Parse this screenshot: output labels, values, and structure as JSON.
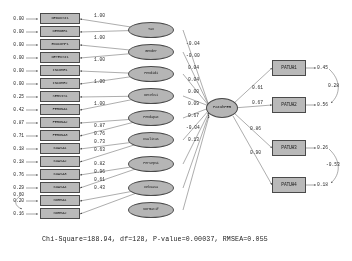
{
  "diagram": {
    "type": "sem-path-diagram",
    "title": "",
    "fit_statistics": "Chi-Square=188.94, df=128, P-value=0.00037, RMSEA=0.055",
    "fit_parts": {
      "chi_square_label": "Chi-Square",
      "chi_square": "188.94",
      "df_label": "df",
      "df": "128",
      "pvalue_label": "P-value",
      "pvalue": "0.00037",
      "rmsea_label": "RMSEA",
      "rmsea": "0.055"
    },
    "center_latent": {
      "label": "PatuhPER"
    },
    "indicators": [
      {
        "error": "0.00",
        "name": "DEDUKSI1",
        "loading": "1.00"
      },
      {
        "error": "0.00",
        "name": "DEMOGR1",
        "loading": "1.00"
      },
      {
        "error": "0.00",
        "name": "EDUCOMP1",
        "loading": "1.00"
      },
      {
        "error": "0.00",
        "name": "DETEKSI1",
        "loading": "1.00"
      },
      {
        "error": "0.00",
        "name": "INCOME1",
        "loading": "1.00"
      },
      {
        "error": "0.00",
        "name": "INCOME2",
        "loading": "1.00"
      },
      {
        "error": "0.25",
        "name": "SERVIS1",
        "loading": "1.00"
      },
      {
        "error": "0.42",
        "name": "FERONA1",
        "loading": "1.00"
      },
      {
        "error": "0.87",
        "name": "FERONA2",
        "loading": "0.87"
      },
      {
        "error": "0.71",
        "name": "FERONA3",
        "loading": "0.76"
      },
      {
        "error": "0.18",
        "name": "KUASA1",
        "loading": "0.73"
      },
      {
        "error": "0.18",
        "name": "KUASA2",
        "loading": "0.63"
      },
      {
        "error": "0.76",
        "name": "KUASA3",
        "loading": "0.82"
      },
      {
        "error": "0.60",
        "name": "KUASA4",
        "loading": "0.96"
      },
      {
        "error": "0.20",
        "name": "NORMA1",
        "loading": "0.61"
      },
      {
        "error": "0.16",
        "name": "NORMA2",
        "loading": "0.43"
      }
    ],
    "extra_error": "0.29",
    "latent_factors": [
      {
        "label": "Tax"
      },
      {
        "label": "Gender"
      },
      {
        "label": "Pendidi"
      },
      {
        "label": "Deteksi"
      },
      {
        "label": "Pendapat"
      },
      {
        "label": "Kualitas"
      },
      {
        "label": "Persepsi"
      },
      {
        "label": "Kekuasa"
      },
      {
        "label": "Normatif"
      }
    ],
    "structural_coefficients": [
      "-0.04",
      "-0.00",
      "0.04",
      "0.04",
      "0.00",
      "0.09",
      "0.67",
      "-0.04",
      "0.13"
    ],
    "outcome_paths": [
      "0.61",
      "0.67",
      "0.86",
      "0.90"
    ],
    "outcomes": [
      {
        "name": "PATUH1",
        "error": "0.45"
      },
      {
        "name": "PATUH2",
        "error": "0.56"
      },
      {
        "name": "PATUH3",
        "error": "0.26"
      },
      {
        "name": "PATUH4",
        "error": "0.18"
      }
    ],
    "outcome_correlations": [
      {
        "value": "0.28",
        "between": "PATUH1-PATUH2"
      },
      {
        "value": "-0.53",
        "between": "PATUH3-PATUH4"
      }
    ]
  }
}
